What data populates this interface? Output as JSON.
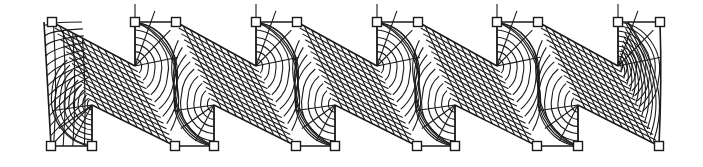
{
  "diagram": {
    "title": "Zig-zag strip finite element mesh",
    "colors": {
      "line": "#1a1a1a",
      "background": "#ffffff",
      "marker_fill": "#ffffff"
    },
    "geometry": {
      "top_y": 22,
      "bottom_y": 146,
      "inner_top_y": 66,
      "inner_bottom_y": 105,
      "marker_size": 9,
      "left_edge": {
        "top": [
          44,
          22
        ],
        "bottom": [
          51,
          146
        ]
      },
      "right_edge": {
        "top": [
          660,
          22
        ],
        "bottom": [
          659,
          146
        ]
      }
    },
    "segments": [
      {
        "id": 1,
        "top_nodes": [
          [
            52,
            22
          ]
        ],
        "bottom_nodes": [
          [
            51,
            146
          ],
          [
            92,
            146
          ]
        ],
        "inner_bottom": [
          92,
          105
        ]
      },
      {
        "id": 2,
        "top_nodes": [
          [
            135,
            22
          ],
          [
            176,
            22
          ]
        ],
        "bottom_nodes": [
          [
            175,
            146
          ],
          [
            214,
            146
          ]
        ],
        "inner_top": [
          135,
          66
        ],
        "inner_bottom": [
          214,
          105
        ]
      },
      {
        "id": 3,
        "top_nodes": [
          [
            256,
            22
          ],
          [
            297,
            22
          ]
        ],
        "bottom_nodes": [
          [
            296,
            146
          ],
          [
            335,
            146
          ]
        ],
        "inner_top": [
          256,
          66
        ],
        "inner_bottom": [
          335,
          105
        ]
      },
      {
        "id": 4,
        "top_nodes": [
          [
            377,
            22
          ],
          [
            418,
            22
          ]
        ],
        "bottom_nodes": [
          [
            417,
            146
          ],
          [
            455,
            146
          ]
        ],
        "inner_top": [
          377,
          66
        ],
        "inner_bottom": [
          455,
          105
        ]
      },
      {
        "id": 5,
        "top_nodes": [
          [
            497,
            22
          ],
          [
            538,
            22
          ]
        ],
        "bottom_nodes": [
          [
            537,
            146
          ],
          [
            578,
            146
          ]
        ],
        "inner_top": [
          497,
          66
        ],
        "inner_bottom": [
          578,
          105
        ]
      },
      {
        "id": 6,
        "top_nodes": [
          [
            618,
            22
          ],
          [
            660,
            22
          ]
        ],
        "bottom_nodes": [
          [
            659,
            146
          ]
        ],
        "inner_top": [
          618,
          66
        ]
      }
    ],
    "mesh": {
      "longitudinal_lines": 14,
      "transverse_lines_per_ramp": 11,
      "arc_rings_per_corner": 9,
      "radial_spokes_per_corner": 4
    }
  }
}
